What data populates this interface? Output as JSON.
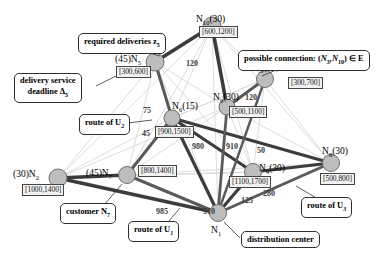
{
  "figure": {
    "type": "graph-diagram",
    "title": ""
  },
  "graph_data": {
    "type": "node-link-diagram",
    "node_label_format": "(demand)N_index  [earliest,latest]",
    "nodes": [
      {
        "id": "N1",
        "index": "1",
        "demand": "",
        "window": "",
        "x": 218,
        "y": 213,
        "r": 8.5,
        "label_side": "below",
        "name": "node-n1"
      },
      {
        "id": "N2",
        "index": "2",
        "demand": "30",
        "window": "[1000,1400]",
        "x": 58,
        "y": 178,
        "r": 9.0,
        "label_side": "left",
        "name": "node-n2"
      },
      {
        "id": "N3",
        "index": "3",
        "demand": "15",
        "window": "[300,700]",
        "x": 265,
        "y": 79,
        "r": 8.5,
        "label_side": "above",
        "name": "node-n3"
      },
      {
        "id": "N4",
        "index": "4",
        "demand": "30",
        "window": "[1100,1700]",
        "x": 253,
        "y": 172,
        "r": 8.5,
        "label_side": "right",
        "name": "node-n4"
      },
      {
        "id": "N5",
        "index": "5",
        "demand": "45",
        "window": "[300,600]",
        "x": 155,
        "y": 62,
        "r": 9.0,
        "label_side": "left",
        "name": "node-n5"
      },
      {
        "id": "N6",
        "index": "6",
        "demand": "15",
        "window": "[900,1500]",
        "x": 172,
        "y": 118,
        "r": 8.0,
        "label_side": "right",
        "name": "node-n6"
      },
      {
        "id": "N7",
        "index": "7",
        "demand": "45",
        "window": "[800,1400]",
        "x": 127,
        "y": 175,
        "r": 8.5,
        "label_side": "left",
        "name": "node-n7"
      },
      {
        "id": "N8",
        "index": "8",
        "demand": "30",
        "window": "[500,800]",
        "x": 331,
        "y": 163,
        "r": 8.5,
        "label_side": "above",
        "name": "node-n8"
      },
      {
        "id": "N9",
        "index": "9",
        "demand": "30",
        "window": "[500,1100]",
        "x": 227,
        "y": 107,
        "r": 8.0,
        "label_side": "left",
        "name": "node-n9"
      },
      {
        "id": "N10",
        "index": "10",
        "demand": "30",
        "window": "[600,1200]",
        "x": 212,
        "y": 26,
        "r": 9.0,
        "label_side": "right",
        "name": "node-n10"
      }
    ],
    "route_edges": [
      {
        "from": "N5",
        "to": "N10",
        "weight": "120",
        "route": "U2",
        "lw": 3.6
      },
      {
        "from": "N10",
        "to": "N9",
        "weight": "",
        "route": "U2",
        "lw": 3.6
      },
      {
        "from": "N9",
        "to": "N3",
        "weight": "120",
        "route": "U2",
        "lw": 3.0
      },
      {
        "from": "N5",
        "to": "N6",
        "weight": "75",
        "route": "U2",
        "lw": 3.0
      },
      {
        "from": "N6",
        "to": "N7",
        "weight": "45",
        "route": "U2",
        "lw": 3.0
      },
      {
        "from": "N7",
        "to": "N2",
        "weight": "",
        "route": "U1",
        "lw": 3.4
      },
      {
        "from": "N2",
        "to": "N1",
        "weight": "",
        "route": "U1",
        "lw": 3.4
      },
      {
        "from": "N7",
        "to": "N1",
        "weight": "985",
        "route": "U1",
        "lw": 3.0
      },
      {
        "from": "N6",
        "to": "N1",
        "weight": "980",
        "route": "U1",
        "lw": 3.2
      },
      {
        "from": "N6",
        "to": "N4",
        "weight": "910",
        "route": "U1",
        "lw": 3.2
      },
      {
        "from": "N6",
        "to": "N8",
        "weight": "50",
        "route": "U3",
        "lw": 3.2
      },
      {
        "from": "N1",
        "to": "N4",
        "weight": "125",
        "route": "U3",
        "lw": 3.2
      },
      {
        "from": "N4",
        "to": "N8",
        "weight": "",
        "route": "U3",
        "lw": 3.2
      },
      {
        "from": "N1",
        "to": "N8",
        "weight": "",
        "route": "U3",
        "lw": 3.0
      },
      {
        "from": "N1",
        "to": "N9",
        "weight": "",
        "route": "U3",
        "lw": 2.8
      },
      {
        "from": "N1",
        "to": "N3",
        "weight": "",
        "route": "U3",
        "lw": 2.4
      }
    ],
    "possible_edges": [
      {
        "from": "N10",
        "to": "N2"
      },
      {
        "from": "N10",
        "to": "N7"
      },
      {
        "from": "N10",
        "to": "N1"
      },
      {
        "from": "N10",
        "to": "N4"
      },
      {
        "from": "N10",
        "to": "N8"
      },
      {
        "from": "N10",
        "to": "N6"
      },
      {
        "from": "N10",
        "to": "N3"
      },
      {
        "from": "N5",
        "to": "N2"
      },
      {
        "from": "N5",
        "to": "N7"
      },
      {
        "from": "N5",
        "to": "N1"
      },
      {
        "from": "N5",
        "to": "N9"
      },
      {
        "from": "N3",
        "to": "N4"
      },
      {
        "from": "N3",
        "to": "N8"
      },
      {
        "from": "N3",
        "to": "N6"
      },
      {
        "from": "N9",
        "to": "N4"
      },
      {
        "from": "N9",
        "to": "N8"
      },
      {
        "from": "N9",
        "to": "N7"
      },
      {
        "from": "N9",
        "to": "N2"
      },
      {
        "from": "N2",
        "to": "N4"
      },
      {
        "from": "N2",
        "to": "N6"
      },
      {
        "from": "N7",
        "to": "N4"
      },
      {
        "from": "N7",
        "to": "N8"
      },
      {
        "from": "N6",
        "to": "N3"
      },
      {
        "from": "N4",
        "to": "N5"
      }
    ],
    "colors": {
      "node_fill": "#bdbdbd",
      "node_stroke": "#6e6e6e",
      "route_edge": "#5a5a5a",
      "route_edge_dark": "#3c3c3c",
      "possible_edge": "#d8d8d8",
      "callout_border": "#2e2e2e",
      "window_box": "#f2f2f2",
      "text": "#000000"
    }
  },
  "node_labels": [
    {
      "name": "label-n10",
      "text": "N",
      "sub": "10",
      "paren": "(30)",
      "window": "[600,1200]"
    },
    {
      "name": "label-n5",
      "text": "N",
      "sub": "5",
      "paren": "(45)",
      "window": "[300,600]"
    },
    {
      "name": "label-n3",
      "text": "N",
      "sub": "3",
      "paren": "(15)",
      "window": "[300,700]"
    },
    {
      "name": "label-n9",
      "text": "N",
      "sub": "9",
      "paren": "(30)",
      "window": "[500,1100]"
    },
    {
      "name": "label-n6",
      "text": "N",
      "sub": "6",
      "paren": "(15)",
      "window": "[900,1500]"
    },
    {
      "name": "label-n2",
      "text": "N",
      "sub": "2",
      "paren": "(30)",
      "window": "[1000,1400]"
    },
    {
      "name": "label-n7",
      "text": "N",
      "sub": "7",
      "paren": "(45)",
      "window": "[800,1400]"
    },
    {
      "name": "label-n4",
      "text": "N",
      "sub": "4",
      "paren": "(30)",
      "window": "[1100,1700]"
    },
    {
      "name": "label-n8",
      "text": "N",
      "sub": "8",
      "paren": "(30)",
      "window": "[500,800]"
    },
    {
      "name": "label-n1",
      "text": "N",
      "sub": "1",
      "paren": "",
      "window": ""
    }
  ],
  "labels": {
    "n10": "N",
    "n10_sub": "10",
    "n10_paren": "(30)",
    "n10_win": "[600,1200]",
    "n5_paren": "(45)",
    "n5": "N",
    "n5_sub": "5",
    "n5_win": "[300,600]",
    "n3": "N",
    "n3_sub": "3",
    "n3_paren": "(15)",
    "n3_win": "[300,700]",
    "n9": "N",
    "n9_sub": "9",
    "n9_paren": "(30)",
    "n9_win": "[500,1100]",
    "n6": "N",
    "n6_sub": "6",
    "n6_paren": "(15)",
    "n6_win": "[900,1500]",
    "n2_paren": "(30)",
    "n2": "N",
    "n2_sub": "2",
    "n2_win": "[1000,1400]",
    "n7_paren": "(45)",
    "n7": "N",
    "n7_sub": "7",
    "n7_win": "[800,1400]",
    "n4": "N",
    "n4_sub": "4",
    "n4_paren": "(30)",
    "n4_win": "[1100,1700]",
    "n8": "N",
    "n8_sub": "8",
    "n8_paren": "(30)",
    "n8_win": "[500,800]",
    "n1": "N",
    "n1_sub": "1"
  },
  "edge_weights": [
    {
      "name": "edge-weight-n5-n10",
      "value": "120",
      "x": 186,
      "y": 59
    },
    {
      "name": "edge-weight-n9-n3",
      "value": "120",
      "x": 245,
      "y": 93
    },
    {
      "name": "edge-weight-n5-n6",
      "value": "75",
      "x": 143,
      "y": 106
    },
    {
      "name": "edge-weight-n6-n7",
      "value": "45",
      "x": 142,
      "y": 129
    },
    {
      "name": "edge-weight-n6-n1",
      "value": "980",
      "x": 192,
      "y": 142
    },
    {
      "name": "edge-weight-n6-n4",
      "value": "910",
      "x": 226,
      "y": 142
    },
    {
      "name": "edge-weight-n7-n1",
      "value": "985",
      "x": 156,
      "y": 207
    },
    {
      "name": "edge-weight-n7-n1b",
      "value": "910",
      "x": 203,
      "y": 207
    },
    {
      "name": "edge-weight-n6-n8",
      "value": "50",
      "x": 257,
      "y": 146
    },
    {
      "name": "edge-weight-n1-n4",
      "value": "125",
      "x": 241,
      "y": 196
    },
    {
      "name": "edge-weight-n1-n4b",
      "value": "280",
      "x": 263,
      "y": 189
    }
  ],
  "callouts": [
    {
      "name": "callout-required-deliveries",
      "text": "required deliveries z",
      "sub": "5",
      "line2": "",
      "x": 78,
      "y": 36,
      "w": 108
    },
    {
      "name": "callout-possible-connection",
      "text": "possible connection: (N",
      "sub": "3",
      "line2": "",
      "x": 240,
      "y": 50,
      "w": 142
    },
    {
      "name": "callout-delivery-deadline",
      "text": "delivery service",
      "line2": "deadline Δ",
      "sub": "5",
      "x": 14,
      "y": 76,
      "w": 82
    },
    {
      "name": "callout-route-u2",
      "text": "route of U",
      "sub": "2",
      "x": 78,
      "y": 117,
      "w": 58
    },
    {
      "name": "callout-customer-n7",
      "text": "customer N",
      "sub": "7",
      "x": 62,
      "y": 203,
      "w": 65
    },
    {
      "name": "callout-route-u1",
      "text": "route of U",
      "sub": "1",
      "x": 128,
      "y": 222,
      "w": 58
    },
    {
      "name": "callout-route-u3",
      "text": "route of U",
      "sub": "3",
      "x": 302,
      "y": 199,
      "w": 58
    },
    {
      "name": "callout-distribution-center",
      "text": "distribution center",
      "x": 242,
      "y": 232,
      "w": 92
    }
  ],
  "callout_text": {
    "required_deliveries": "required deliveries z",
    "required_deliveries_sub": "5",
    "possible_connection_pre": "possible connection: (",
    "possible_connection_n": "N",
    "possible_connection_sub1": "3",
    "possible_connection_mid": ",N",
    "possible_connection_sub2": "10",
    "possible_connection_post": ") ∈ E",
    "delivery_service": "delivery service",
    "deadline": "deadline Δ",
    "deadline_sub": "5",
    "route_u2": "route of U",
    "route_u2_sub": "2",
    "customer": "customer N",
    "customer_sub": "7",
    "route_u1": "route of U",
    "route_u1_sub": "1",
    "route_u3": "route of U",
    "route_u3_sub": "3",
    "distribution_center": "distribution center"
  }
}
